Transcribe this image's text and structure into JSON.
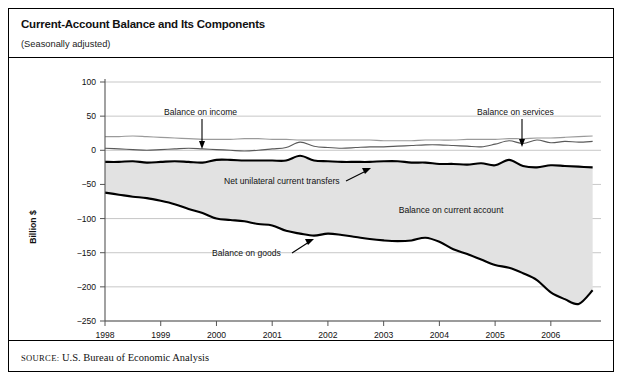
{
  "header": {
    "title": "Current-Account Balance and Its Components",
    "subtitle": "(Seasonally adjusted)"
  },
  "source": {
    "label": "SOURCE:",
    "text": "U.S. Bureau of Economic Analysis"
  },
  "annotations": {
    "income": "Balance on income",
    "services": "Balance on services",
    "transfers": "Net unilateral current transfers",
    "current_account": "Balance on current account",
    "goods": "Balance on goods"
  },
  "axis": {
    "ylabel": "Billion $",
    "yticks": [
      "100",
      "50",
      "0",
      "-50",
      "-100",
      "-150",
      "-200",
      "-250"
    ],
    "xticks": [
      "1998",
      "1999",
      "2000",
      "2001",
      "2002",
      "2003",
      "2004",
      "2005",
      "2006"
    ]
  },
  "colors": {
    "band": "#e2e2e2",
    "bold_line": "#000000",
    "thin_line": "#5a5a5a",
    "thin_line_light": "#9a9a9a",
    "grid": "#b9b9b9"
  },
  "chart_data": {
    "type": "line",
    "title": "Current-Account Balance and Its Components",
    "subtitle": "(Seasonally adjusted)",
    "xlabel": "",
    "ylabel": "Billion $",
    "ylim": [
      -250,
      100
    ],
    "xlim": [
      1998.0,
      2006.9
    ],
    "grid": true,
    "legend": "annotations-inline",
    "x": [
      1998.0,
      1998.25,
      1998.5,
      1998.75,
      1999.0,
      1999.25,
      1999.5,
      1999.75,
      2000.0,
      2000.25,
      2000.5,
      2000.75,
      2001.0,
      2001.25,
      2001.5,
      2001.75,
      2002.0,
      2002.25,
      2002.5,
      2002.75,
      2003.0,
      2003.25,
      2003.5,
      2003.75,
      2004.0,
      2004.25,
      2004.5,
      2004.75,
      2005.0,
      2005.25,
      2005.5,
      2005.75,
      2006.0,
      2006.25,
      2006.5,
      2006.75
    ],
    "series": [
      {
        "name": "Balance on services",
        "style": "thin-light",
        "values": [
          20,
          20,
          21,
          20,
          19,
          18,
          17,
          16,
          16,
          16,
          17,
          17,
          16,
          16,
          15,
          15,
          15,
          15,
          15,
          15,
          14,
          14,
          14,
          15,
          15,
          15,
          16,
          16,
          16,
          17,
          17,
          18,
          18,
          19,
          20,
          21
        ]
      },
      {
        "name": "Balance on income",
        "style": "thin-dark",
        "values": [
          3,
          2,
          1,
          0,
          1,
          2,
          3,
          2,
          1,
          0,
          -1,
          0,
          2,
          4,
          12,
          6,
          4,
          3,
          4,
          5,
          5,
          6,
          7,
          8,
          8,
          7,
          6,
          5,
          9,
          14,
          10,
          15,
          11,
          13,
          12,
          13
        ]
      },
      {
        "name": "Net unilateral current transfers",
        "style": "bold",
        "values": [
          -17,
          -17,
          -16,
          -18,
          -17,
          -16,
          -17,
          -18,
          -14,
          -14,
          -15,
          -15,
          -15,
          -15,
          -8,
          -15,
          -16,
          -17,
          -17,
          -17,
          -16,
          -16,
          -18,
          -18,
          -20,
          -20,
          -21,
          -19,
          -22,
          -14,
          -23,
          -25,
          -22,
          -23,
          -24,
          -25
        ]
      },
      {
        "name": "Balance on goods",
        "style": "bold",
        "values": [
          -62,
          -65,
          -68,
          -70,
          -74,
          -79,
          -86,
          -92,
          -100,
          -102,
          -104,
          -108,
          -110,
          -118,
          -122,
          -125,
          -122,
          -124,
          -127,
          -130,
          -132,
          -133,
          -132,
          -128,
          -134,
          -145,
          -152,
          -160,
          -168,
          -172,
          -180,
          -190,
          -208,
          -218,
          -225,
          -205
        ]
      }
    ],
    "shaded_region": {
      "name": "Balance on current account",
      "between": [
        "Net unilateral current transfers",
        "Balance on goods"
      ],
      "fill": "#e2e2e2"
    }
  }
}
